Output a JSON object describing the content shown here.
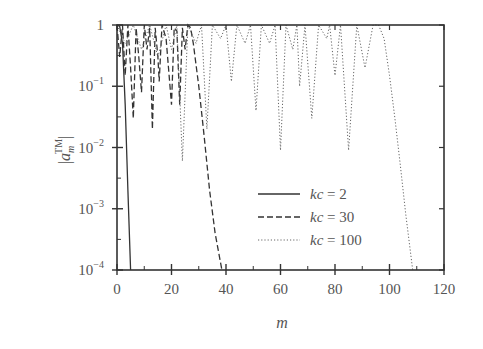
{
  "chart_data": {
    "type": "line",
    "title": "",
    "xlabel": "m",
    "ylabel": "|a_m^TM|",
    "ylabel_parts": {
      "base": "a",
      "sub": "m",
      "sup": "TM"
    },
    "xlim": [
      0,
      120
    ],
    "ylim": [
      0.0001,
      1
    ],
    "yscale": "log",
    "grid": false,
    "legend_position": "lower-center-right",
    "x_ticks": [
      0,
      20,
      40,
      60,
      80,
      100,
      120
    ],
    "x_tick_labels": [
      "0",
      "20",
      "40",
      "60",
      "80",
      "100",
      "120"
    ],
    "y_ticks": [
      1,
      0.1,
      0.01,
      0.001,
      0.0001
    ],
    "y_tick_labels": [
      {
        "base": "1",
        "exp": ""
      },
      {
        "base": "10",
        "exp": "−1"
      },
      {
        "base": "10",
        "exp": "−2"
      },
      {
        "base": "10",
        "exp": "−3"
      },
      {
        "base": "10",
        "exp": "−4"
      }
    ],
    "series": [
      {
        "name": "kc=2",
        "legend_prefix": "kc",
        "legend_value": "2",
        "style": "solid",
        "color": "#333333",
        "points": [
          [
            0,
            1
          ],
          [
            1,
            0.95
          ],
          [
            2,
            0.5
          ],
          [
            3,
            0.05
          ],
          [
            4,
            0.002
          ],
          [
            5,
            0.0001
          ]
        ]
      },
      {
        "name": "kc=30",
        "legend_prefix": "kc",
        "legend_value": "30",
        "style": "dashed",
        "color": "#333333",
        "points": [
          [
            0,
            1
          ],
          [
            1,
            0.3
          ],
          [
            2,
            1
          ],
          [
            3,
            0.15
          ],
          [
            4,
            1
          ],
          [
            5,
            0.2
          ],
          [
            6,
            0.03
          ],
          [
            7,
            0.9
          ],
          [
            8,
            0.3
          ],
          [
            9,
            0.08
          ],
          [
            10,
            1
          ],
          [
            11,
            0.4
          ],
          [
            12,
            0.9
          ],
          [
            13,
            0.02
          ],
          [
            14,
            0.9
          ],
          [
            15,
            0.3
          ],
          [
            15.5,
            0.12
          ],
          [
            16.5,
            1
          ],
          [
            18,
            0.6
          ],
          [
            20,
            0.05
          ],
          [
            21,
            0.9
          ],
          [
            22,
            0.8
          ],
          [
            23,
            0.05
          ],
          [
            24,
            0.9
          ],
          [
            25,
            0.4
          ],
          [
            26,
            1
          ],
          [
            27,
            0.9
          ],
          [
            28,
            0.5
          ],
          [
            30,
            0.1
          ],
          [
            32,
            0.015
          ],
          [
            34,
            0.002
          ],
          [
            36,
            0.0004
          ],
          [
            38.5,
            0.0001
          ]
        ]
      },
      {
        "name": "kc=100",
        "legend_prefix": "kc",
        "legend_value": "100",
        "style": "dotted",
        "color": "#666666",
        "points": [
          [
            0,
            1
          ],
          [
            3,
            0.5
          ],
          [
            6,
            1
          ],
          [
            9,
            0.4
          ],
          [
            12,
            1
          ],
          [
            15,
            0.3
          ],
          [
            18,
            1
          ],
          [
            20,
            0.4
          ],
          [
            22,
            1
          ],
          [
            24,
            0.006
          ],
          [
            26,
            1
          ],
          [
            29,
            0.5
          ],
          [
            31,
            1
          ],
          [
            33,
            0.02
          ],
          [
            35,
            1
          ],
          [
            38,
            0.6
          ],
          [
            40,
            1
          ],
          [
            42,
            0.12
          ],
          [
            44,
            1
          ],
          [
            47,
            0.5
          ],
          [
            49,
            1
          ],
          [
            51,
            0.04
          ],
          [
            53,
            1
          ],
          [
            56,
            0.5
          ],
          [
            58,
            1
          ],
          [
            60,
            0.009
          ],
          [
            62,
            1
          ],
          [
            64.5,
            0.4
          ],
          [
            66,
            1
          ],
          [
            67,
            0.1
          ],
          [
            69,
            1
          ],
          [
            71.5,
            0.03
          ],
          [
            74,
            1
          ],
          [
            77,
            0.6
          ],
          [
            78,
            1
          ],
          [
            80,
            0.15
          ],
          [
            82,
            1
          ],
          [
            85,
            0.009
          ],
          [
            88,
            1
          ],
          [
            91,
            0.2
          ],
          [
            94,
            1
          ],
          [
            96,
            1
          ],
          [
            98,
            0.6
          ],
          [
            100,
            0.15
          ],
          [
            102,
            0.03
          ],
          [
            104,
            0.005
          ],
          [
            106,
            0.0008
          ],
          [
            108.5,
            0.0001
          ]
        ]
      }
    ]
  }
}
